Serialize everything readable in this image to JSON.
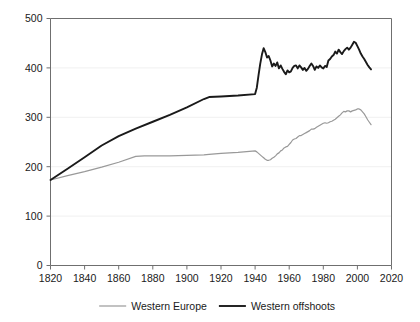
{
  "chart_data": {
    "type": "line",
    "title": "",
    "subtitle": "",
    "xlabel": "",
    "ylabel": "",
    "xlim": [
      1820,
      2020
    ],
    "ylim": [
      0,
      500
    ],
    "grid": true,
    "legend_position": "bottom",
    "xticks": [
      1820,
      1840,
      1860,
      1880,
      1900,
      1920,
      1940,
      1960,
      1980,
      2000,
      2020
    ],
    "yticks": [
      0,
      100,
      200,
      300,
      400,
      500
    ],
    "xtick_labels": [
      "1820",
      "1840",
      "1860",
      "1880",
      "1900",
      "1920",
      "1940",
      "1960",
      "1980",
      "2000",
      "2020"
    ],
    "ytick_labels": [
      "0",
      "100",
      "200",
      "300",
      "400",
      "500"
    ],
    "series": [
      {
        "name": "Western Europe",
        "color": "#999999",
        "width": 1.2,
        "x": [
          1820,
          1830,
          1840,
          1850,
          1860,
          1870,
          1875,
          1880,
          1890,
          1900,
          1910,
          1913,
          1920,
          1930,
          1940,
          1941,
          1942,
          1943,
          1944,
          1945,
          1946,
          1947,
          1948,
          1949,
          1950,
          1951,
          1952,
          1953,
          1954,
          1955,
          1956,
          1957,
          1958,
          1959,
          1960,
          1961,
          1962,
          1963,
          1964,
          1965,
          1966,
          1967,
          1968,
          1969,
          1970,
          1971,
          1972,
          1973,
          1974,
          1975,
          1976,
          1977,
          1978,
          1979,
          1980,
          1981,
          1982,
          1983,
          1984,
          1985,
          1986,
          1987,
          1988,
          1989,
          1990,
          1991,
          1992,
          1993,
          1994,
          1995,
          1996,
          1997,
          1998,
          1999,
          2000,
          2001,
          2002,
          2003,
          2004,
          2005,
          2006,
          2007,
          2008
        ],
        "y": [
          173,
          182,
          190,
          199,
          209,
          221,
          222,
          222,
          222,
          223,
          224,
          225,
          227,
          229,
          232,
          230,
          227,
          224,
          221,
          218,
          215,
          213,
          213,
          214,
          217,
          219,
          222,
          226,
          228,
          232,
          234,
          238,
          240,
          241,
          245,
          249,
          254,
          256,
          257,
          260,
          263,
          263,
          265,
          267,
          269,
          271,
          273,
          276,
          276,
          277,
          280,
          282,
          284,
          286,
          288,
          289,
          288,
          289,
          291,
          292,
          294,
          296,
          299,
          302,
          305,
          309,
          312,
          311,
          313,
          313,
          311,
          313,
          314,
          315,
          317,
          317,
          315,
          311,
          307,
          301,
          295,
          290,
          285
        ]
      },
      {
        "name": "Western offshoots",
        "color": "#1a1a1a",
        "width": 1.9,
        "x": [
          1820,
          1830,
          1840,
          1850,
          1860,
          1870,
          1880,
          1890,
          1900,
          1910,
          1913,
          1920,
          1930,
          1940,
          1941,
          1942,
          1943,
          1944,
          1945,
          1946,
          1947,
          1948,
          1949,
          1950,
          1951,
          1952,
          1953,
          1954,
          1955,
          1956,
          1957,
          1958,
          1959,
          1960,
          1961,
          1962,
          1963,
          1964,
          1965,
          1966,
          1967,
          1968,
          1969,
          1970,
          1971,
          1972,
          1973,
          1974,
          1975,
          1976,
          1977,
          1978,
          1979,
          1980,
          1981,
          1982,
          1983,
          1984,
          1985,
          1986,
          1987,
          1988,
          1989,
          1990,
          1991,
          1992,
          1993,
          1994,
          1995,
          1996,
          1997,
          1998,
          1999,
          2000,
          2001,
          2002,
          2003,
          2004,
          2005,
          2006,
          2007,
          2008
        ],
        "y": [
          173,
          196,
          219,
          243,
          262,
          277,
          291,
          305,
          320,
          337,
          341,
          342,
          344,
          347,
          360,
          385,
          408,
          427,
          440,
          432,
          421,
          424,
          415,
          403,
          409,
          404,
          411,
          399,
          405,
          398,
          392,
          387,
          395,
          391,
          393,
          400,
          404,
          405,
          399,
          405,
          401,
          396,
          400,
          394,
          398,
          404,
          409,
          404,
          396,
          403,
          400,
          405,
          401,
          399,
          404,
          402,
          415,
          418,
          423,
          426,
          433,
          429,
          437,
          432,
          428,
          434,
          438,
          441,
          437,
          441,
          447,
          453,
          451,
          444,
          437,
          429,
          423,
          418,
          412,
          406,
          401,
          397
        ]
      }
    ]
  },
  "legend": {
    "items": [
      {
        "label": "Western Europe",
        "color": "#999999"
      },
      {
        "label": "Western offshoots",
        "color": "#1a1a1a"
      }
    ]
  }
}
